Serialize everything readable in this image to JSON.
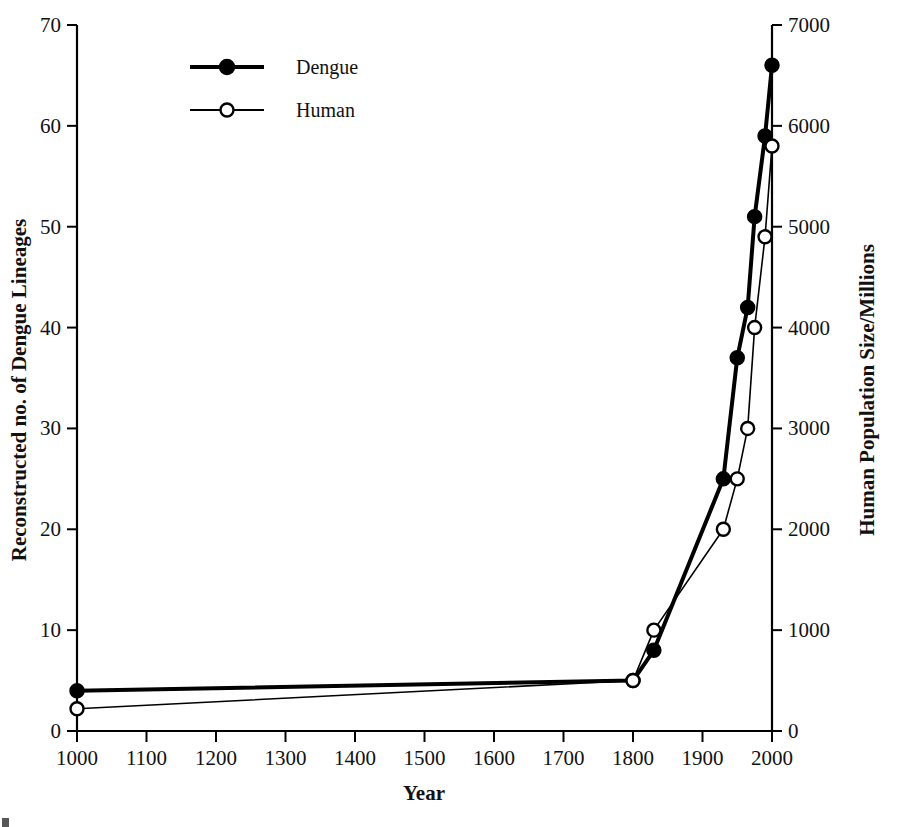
{
  "chart_data": {
    "type": "line",
    "title": "",
    "xlabel": "Year",
    "ylabel": "Reconstructed no. of Dengue Lineages",
    "y2label": "Human Population Size/Millions",
    "xlim": [
      1000,
      2000
    ],
    "ylim": [
      0,
      70
    ],
    "y2lim": [
      0,
      7000
    ],
    "grid": false,
    "legend_position": "top-center-left",
    "x_ticks": [
      1000,
      1100,
      1200,
      1300,
      1400,
      1500,
      1600,
      1700,
      1800,
      1900,
      2000
    ],
    "x_tick_labels": [
      "1000",
      "1100",
      "1200",
      "1300",
      "1400",
      "1500",
      "1600",
      "1700",
      "1800",
      "1900",
      "2000"
    ],
    "y_ticks": [
      0,
      10,
      20,
      30,
      40,
      50,
      60,
      70
    ],
    "y_tick_labels": [
      "0",
      "10",
      "20",
      "30",
      "40",
      "50",
      "60",
      "70"
    ],
    "y2_ticks": [
      0,
      1000,
      2000,
      3000,
      4000,
      5000,
      6000,
      7000
    ],
    "y2_tick_labels": [
      "0",
      "1000",
      "2000",
      "3000",
      "4000",
      "5000",
      "6000",
      "7000"
    ],
    "series": [
      {
        "name": "Dengue",
        "axis": "left",
        "marker": "filled-circle",
        "line_width": 4,
        "color": "#000000",
        "x": [
          1000,
          1800,
          1830,
          1930,
          1950,
          1965,
          1975,
          1990,
          2000
        ],
        "values": [
          4,
          5,
          8,
          25,
          37,
          42,
          51,
          59,
          66
        ]
      },
      {
        "name": "Human",
        "axis": "right",
        "marker": "open-circle",
        "line_width": 1.6,
        "color": "#000000",
        "x": [
          1000,
          1800,
          1830,
          1930,
          1950,
          1965,
          1975,
          1990,
          2000
        ],
        "values": [
          220,
          500,
          1000,
          2000,
          2500,
          3000,
          4000,
          4900,
          5800
        ]
      }
    ]
  },
  "legend": {
    "entries": [
      {
        "label": "Dengue",
        "marker": "filled-circle"
      },
      {
        "label": "Human",
        "marker": "open-circle"
      }
    ]
  },
  "axes": {
    "x_title": "Year",
    "y_left_title": "Reconstructed no. of Dengue Lineages",
    "y_right_title": "Human Population Size/Millions"
  }
}
